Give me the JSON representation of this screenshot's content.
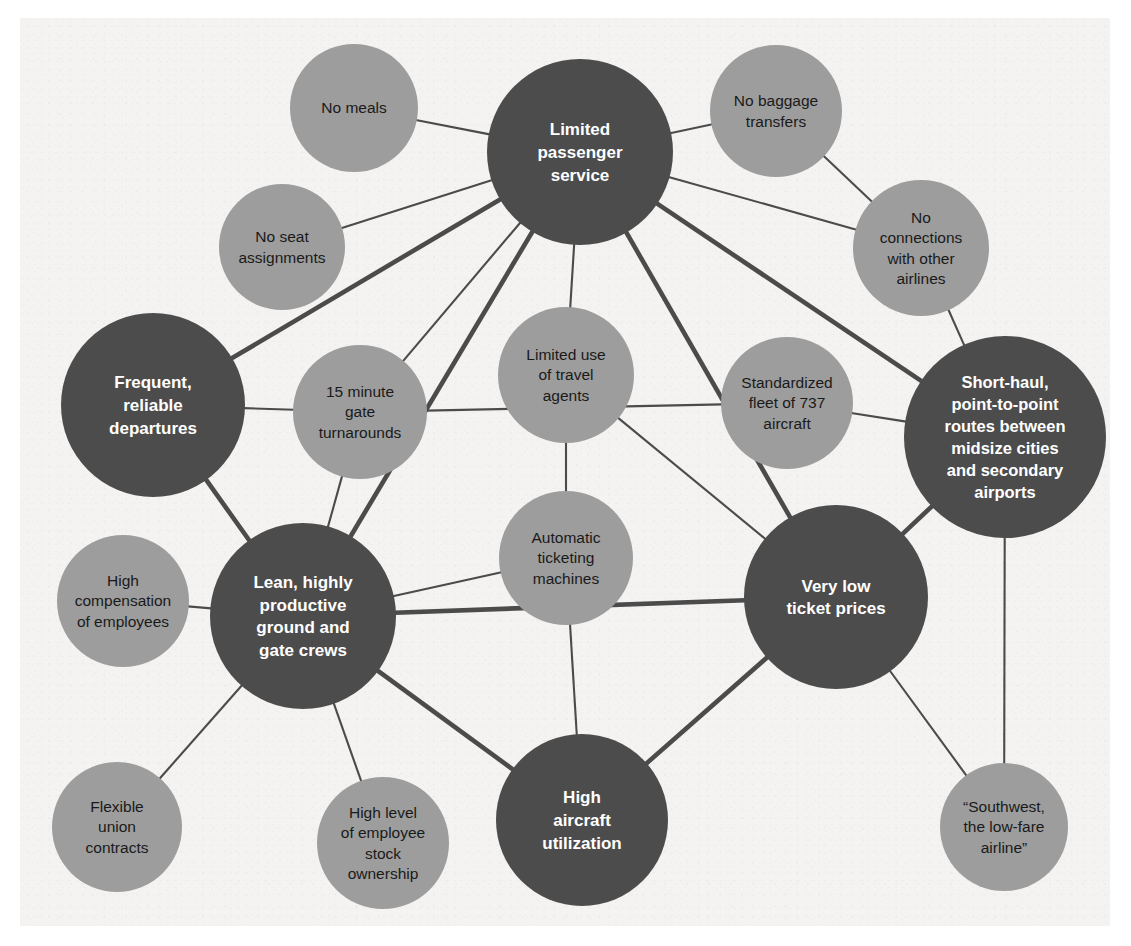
{
  "diagram": {
    "colors": {
      "background": "#f4f3f1",
      "node_primary": "#4c4c4c",
      "node_secondary": "#9d9d9d",
      "edge": "#4b4b4b",
      "label_on_primary": "#ffffff",
      "label_on_secondary": "#1a1a1a"
    },
    "nodes": [
      {
        "id": "limited_passenger_service",
        "kind": "primary",
        "cx": 580,
        "cy": 152,
        "r": 93,
        "font": 17,
        "lines": [
          "Limited",
          "passenger",
          "service"
        ]
      },
      {
        "id": "no_meals",
        "kind": "secondary",
        "cx": 354,
        "cy": 108,
        "r": 64,
        "font": 15.5,
        "lines": [
          "No meals"
        ]
      },
      {
        "id": "no_seat_assignments",
        "kind": "secondary",
        "cx": 282,
        "cy": 247,
        "r": 63,
        "font": 15.5,
        "lines": [
          "No seat",
          "assignments"
        ]
      },
      {
        "id": "no_baggage_transfers",
        "kind": "secondary",
        "cx": 776,
        "cy": 111,
        "r": 66,
        "font": 15.5,
        "lines": [
          "No baggage",
          "transfers"
        ]
      },
      {
        "id": "no_connections_with_other_airlines",
        "kind": "secondary",
        "cx": 921,
        "cy": 248,
        "r": 68,
        "font": 15.5,
        "lines": [
          "No",
          "connections",
          "with other",
          "airlines"
        ]
      },
      {
        "id": "frequent_reliable_departures",
        "kind": "primary",
        "cx": 153,
        "cy": 405,
        "r": 92,
        "font": 17,
        "lines": [
          "Frequent,",
          "reliable",
          "departures"
        ]
      },
      {
        "id": "fifteen_minute_gate_turnarounds",
        "kind": "secondary",
        "cx": 360,
        "cy": 412,
        "r": 67,
        "font": 15.5,
        "lines": [
          "15 minute",
          "gate",
          "turnarounds"
        ]
      },
      {
        "id": "limited_use_of_travel_agents",
        "kind": "secondary",
        "cx": 566,
        "cy": 375,
        "r": 68,
        "font": 15.5,
        "lines": [
          "Limited use",
          "of travel",
          "agents"
        ]
      },
      {
        "id": "standardized_fleet_737",
        "kind": "secondary",
        "cx": 787,
        "cy": 403,
        "r": 66,
        "font": 15.5,
        "lines": [
          "Standardized",
          "fleet of 737",
          "aircraft"
        ]
      },
      {
        "id": "short_haul_point_to_point",
        "kind": "primary",
        "cx": 1005,
        "cy": 437,
        "r": 101,
        "font": 16.5,
        "lines": [
          "Short-haul,",
          "point-to-point",
          "routes between",
          "midsize cities",
          "and secondary",
          "airports"
        ]
      },
      {
        "id": "high_compensation_of_employees",
        "kind": "secondary",
        "cx": 123,
        "cy": 601,
        "r": 66,
        "font": 15.5,
        "lines": [
          "High",
          "compensation",
          "of employees"
        ]
      },
      {
        "id": "lean_productive_crews",
        "kind": "primary",
        "cx": 303,
        "cy": 616,
        "r": 93,
        "font": 17,
        "lines": [
          "Lean, highly",
          "productive",
          "ground and",
          "gate crews"
        ]
      },
      {
        "id": "automatic_ticketing_machines",
        "kind": "secondary",
        "cx": 566,
        "cy": 558,
        "r": 67,
        "font": 15.5,
        "lines": [
          "Automatic",
          "ticketing",
          "machines"
        ]
      },
      {
        "id": "very_low_ticket_prices",
        "kind": "primary",
        "cx": 836,
        "cy": 597,
        "r": 92,
        "font": 17,
        "lines": [
          "Very low",
          "ticket prices"
        ]
      },
      {
        "id": "flexible_union_contracts",
        "kind": "secondary",
        "cx": 117,
        "cy": 827,
        "r": 65,
        "font": 15.5,
        "lines": [
          "Flexible",
          "union",
          "contracts"
        ]
      },
      {
        "id": "high_level_employee_stock_ownership",
        "kind": "secondary",
        "cx": 383,
        "cy": 843,
        "r": 66,
        "font": 15.5,
        "lines": [
          "High level",
          "of employee",
          "stock",
          "ownership"
        ]
      },
      {
        "id": "high_aircraft_utilization",
        "kind": "primary",
        "cx": 582,
        "cy": 820,
        "r": 86,
        "font": 17,
        "lines": [
          "High",
          "aircraft",
          "utilization"
        ]
      },
      {
        "id": "southwest_low_fare_airline",
        "kind": "secondary",
        "cx": 1004,
        "cy": 827,
        "r": 64,
        "font": 15.5,
        "lines": [
          "“Southwest,",
          "the low-fare",
          "airline”"
        ]
      }
    ],
    "edges": [
      {
        "from": "no_meals",
        "to": "limited_passenger_service",
        "weight": "thin"
      },
      {
        "from": "no_seat_assignments",
        "to": "limited_passenger_service",
        "weight": "thin"
      },
      {
        "from": "no_baggage_transfers",
        "to": "limited_passenger_service",
        "weight": "thin"
      },
      {
        "from": "no_baggage_transfers",
        "to": "no_connections_with_other_airlines",
        "weight": "thin"
      },
      {
        "from": "no_connections_with_other_airlines",
        "to": "limited_passenger_service",
        "weight": "thin"
      },
      {
        "from": "no_connections_with_other_airlines",
        "to": "short_haul_point_to_point",
        "weight": "thin"
      },
      {
        "from": "limited_passenger_service",
        "to": "frequent_reliable_departures",
        "weight": "thick"
      },
      {
        "from": "limited_passenger_service",
        "to": "fifteen_minute_gate_turnarounds",
        "weight": "thin"
      },
      {
        "from": "limited_passenger_service",
        "to": "limited_use_of_travel_agents",
        "weight": "thin"
      },
      {
        "from": "limited_passenger_service",
        "to": "lean_productive_crews",
        "weight": "thick"
      },
      {
        "from": "limited_passenger_service",
        "to": "very_low_ticket_prices",
        "weight": "thick"
      },
      {
        "from": "limited_passenger_service",
        "to": "short_haul_point_to_point",
        "weight": "thick"
      },
      {
        "from": "frequent_reliable_departures",
        "to": "fifteen_minute_gate_turnarounds",
        "weight": "thin"
      },
      {
        "from": "frequent_reliable_departures",
        "to": "lean_productive_crews",
        "weight": "thick"
      },
      {
        "from": "fifteen_minute_gate_turnarounds",
        "to": "lean_productive_crews",
        "weight": "thin"
      },
      {
        "from": "fifteen_minute_gate_turnarounds",
        "to": "standardized_fleet_737",
        "weight": "thin"
      },
      {
        "from": "limited_use_of_travel_agents",
        "to": "automatic_ticketing_machines",
        "weight": "thin"
      },
      {
        "from": "limited_use_of_travel_agents",
        "to": "very_low_ticket_prices",
        "weight": "thin"
      },
      {
        "from": "standardized_fleet_737",
        "to": "short_haul_point_to_point",
        "weight": "thin"
      },
      {
        "from": "short_haul_point_to_point",
        "to": "very_low_ticket_prices",
        "weight": "thick"
      },
      {
        "from": "short_haul_point_to_point",
        "to": "southwest_low_fare_airline",
        "weight": "thin"
      },
      {
        "from": "high_compensation_of_employees",
        "to": "lean_productive_crews",
        "weight": "thin"
      },
      {
        "from": "lean_productive_crews",
        "to": "automatic_ticketing_machines",
        "weight": "thin"
      },
      {
        "from": "lean_productive_crews",
        "to": "very_low_ticket_prices",
        "weight": "thick"
      },
      {
        "from": "lean_productive_crews",
        "to": "flexible_union_contracts",
        "weight": "thin"
      },
      {
        "from": "lean_productive_crews",
        "to": "high_level_employee_stock_ownership",
        "weight": "thin"
      },
      {
        "from": "lean_productive_crews",
        "to": "high_aircraft_utilization",
        "weight": "thick"
      },
      {
        "from": "automatic_ticketing_machines",
        "to": "high_aircraft_utilization",
        "weight": "thin"
      },
      {
        "from": "very_low_ticket_prices",
        "to": "high_aircraft_utilization",
        "weight": "thick"
      },
      {
        "from": "very_low_ticket_prices",
        "to": "southwest_low_fare_airline",
        "weight": "thin"
      }
    ]
  }
}
